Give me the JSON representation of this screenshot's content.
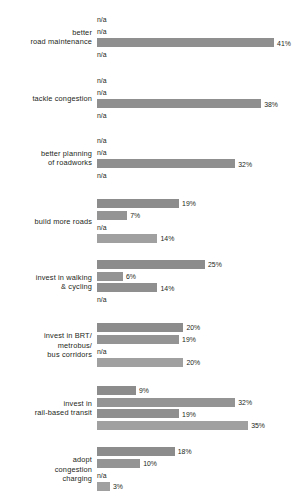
{
  "chart_data": {
    "type": "bar",
    "orientation": "horizontal",
    "title": "",
    "subtitle": "",
    "xlabel": "",
    "ylabel": "",
    "xlim": [
      0,
      100
    ],
    "grid": false,
    "legend_position": "none",
    "value_suffix": "%",
    "missing_label": "n/a",
    "categories": [
      "better\nroad maintenance",
      "tackle congestion",
      "better planning\nof roadworks",
      "build more roads",
      "invest in walking\n& cycling",
      "invest in BRT/\nmetrobus/\nbus corridors",
      "invest in\nrail-based transit",
      "adopt\ncongestion\ncharging"
    ],
    "series": [
      {
        "name": "series-1",
        "color": "#8c8c8c",
        "values": [
          null,
          null,
          null,
          19,
          25,
          20,
          9,
          18
        ],
        "labels": [
          "n/a",
          "n/a",
          "n/a",
          "19%",
          "25%",
          "20%",
          "9%",
          "18%"
        ]
      },
      {
        "name": "series-2",
        "color": "#949494",
        "values": [
          null,
          null,
          null,
          7,
          6,
          19,
          32,
          10
        ],
        "labels": [
          "n/a",
          "n/a",
          "n/a",
          "7%",
          "6%",
          "19%",
          "32%",
          "10%"
        ]
      },
      {
        "name": "series-3",
        "color": "#8f8f8f",
        "values": [
          41,
          38,
          32,
          null,
          14,
          null,
          19,
          null
        ],
        "labels": [
          "41%",
          "38%",
          "32%",
          "n/a",
          "14%",
          "n/a",
          "19%",
          "n/a"
        ]
      },
      {
        "name": "series-4",
        "color": "#a0a0a0",
        "values": [
          null,
          null,
          null,
          14,
          null,
          20,
          35,
          3
        ],
        "labels": [
          "n/a",
          "n/a",
          "n/a",
          "14%",
          "n/a",
          "20%",
          "35%",
          "3%"
        ]
      }
    ]
  },
  "groups": [
    {
      "label": "better\nroad maintenance",
      "rows": [
        {
          "label": "n/a",
          "value": null
        },
        {
          "label": "n/a",
          "value": null
        },
        {
          "label": "41%",
          "value": 41
        },
        {
          "label": "n/a",
          "value": null
        }
      ]
    },
    {
      "label": "tackle congestion",
      "rows": [
        {
          "label": "n/a",
          "value": null
        },
        {
          "label": "n/a",
          "value": null
        },
        {
          "label": "38%",
          "value": 38
        },
        {
          "label": "n/a",
          "value": null
        }
      ]
    },
    {
      "label": "better planning\nof roadworks",
      "rows": [
        {
          "label": "n/a",
          "value": null
        },
        {
          "label": "n/a",
          "value": null
        },
        {
          "label": "32%",
          "value": 32
        },
        {
          "label": "n/a",
          "value": null
        }
      ]
    },
    {
      "label": "build more roads",
      "rows": [
        {
          "label": "19%",
          "value": 19
        },
        {
          "label": "7%",
          "value": 7
        },
        {
          "label": "n/a",
          "value": null
        },
        {
          "label": "14%",
          "value": 14
        }
      ]
    },
    {
      "label": "invest in walking\n& cycling",
      "rows": [
        {
          "label": "25%",
          "value": 25
        },
        {
          "label": "6%",
          "value": 6
        },
        {
          "label": "14%",
          "value": 14
        },
        {
          "label": "n/a",
          "value": null
        }
      ]
    },
    {
      "label": "invest in BRT/\nmetrobus/\nbus corridors",
      "rows": [
        {
          "label": "20%",
          "value": 20
        },
        {
          "label": "19%",
          "value": 19
        },
        {
          "label": "n/a",
          "value": null
        },
        {
          "label": "20%",
          "value": 20
        }
      ]
    },
    {
      "label": "invest in\nrail-based transit",
      "rows": [
        {
          "label": "9%",
          "value": 9
        },
        {
          "label": "32%",
          "value": 32
        },
        {
          "label": "19%",
          "value": 19
        },
        {
          "label": "35%",
          "value": 35
        }
      ]
    },
    {
      "label": "adopt\ncongestion\ncharging",
      "rows": [
        {
          "label": "18%",
          "value": 18
        },
        {
          "label": "10%",
          "value": 10
        },
        {
          "label": "n/a",
          "value": null
        },
        {
          "label": "3%",
          "value": 3
        }
      ]
    }
  ],
  "layout": {
    "group_tops": [
      14,
      75,
      135,
      198,
      259,
      322,
      385,
      446
    ],
    "row_height": 11.6,
    "bar_left": 97,
    "px_per_percent": 4.32,
    "series_colors": [
      "#8c8c8c",
      "#949494",
      "#8f8f8f",
      "#a0a0a0"
    ]
  }
}
